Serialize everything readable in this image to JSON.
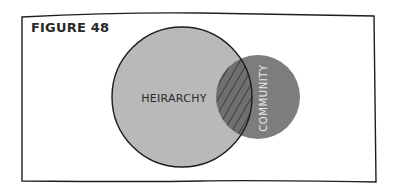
{
  "figure": {
    "title": "FIGURE 48"
  },
  "diagram": {
    "type": "venn",
    "sets": [
      {
        "name": "HEIRARCHY",
        "fill": "#b9b9b9",
        "outline": "#1c1c1c"
      },
      {
        "name": "COMMUNITY",
        "fill": "#7d7d7d"
      }
    ],
    "overlap": {
      "style": "hatched",
      "color": "#4a4a4a"
    }
  }
}
